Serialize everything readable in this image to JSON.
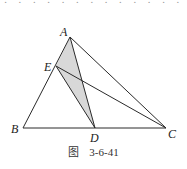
{
  "diagram": {
    "type": "geometry-triangle",
    "points": {
      "A": {
        "x": 70,
        "y": 37
      },
      "E": {
        "x": 56,
        "y": 66
      },
      "B": {
        "x": 23,
        "y": 128
      },
      "D": {
        "x": 95,
        "y": 128
      },
      "C": {
        "x": 166,
        "y": 128
      }
    },
    "segments": [
      "AB",
      "AC",
      "BC",
      "AD",
      "ED",
      "EC"
    ],
    "shaded_region": [
      "A",
      "E",
      "D"
    ],
    "shade_color": "#d8d8d8",
    "line_color": "#2a2a2a",
    "labels": {
      "A": "A",
      "E": "E",
      "B": "B",
      "D": "D",
      "C": "C"
    }
  },
  "caption": {
    "prefix": "图",
    "number": "3-6-41"
  }
}
